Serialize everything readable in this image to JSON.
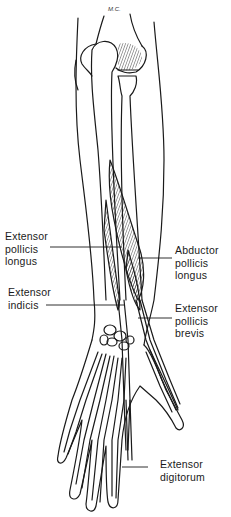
{
  "figure": {
    "signature": "M.C.",
    "colors": {
      "line": "#1a1a1a",
      "background": "#ffffff"
    }
  },
  "labels": [
    {
      "id": "extensor-pollicis-longus",
      "lines": [
        "Extensor",
        "pollicis",
        "longus"
      ],
      "side": "left"
    },
    {
      "id": "extensor-indicis",
      "lines": [
        "Extensor",
        "indicis"
      ],
      "side": "left"
    },
    {
      "id": "abductor-pollicis-longus",
      "lines": [
        "Abductor",
        "pollicis",
        "longus"
      ],
      "side": "right"
    },
    {
      "id": "extensor-pollicis-brevis",
      "lines": [
        "Extensor",
        "pollicis",
        "brevis"
      ],
      "side": "right"
    },
    {
      "id": "extensor-digitorum",
      "lines": [
        "Extensor",
        "digitorum"
      ],
      "side": "right"
    }
  ]
}
